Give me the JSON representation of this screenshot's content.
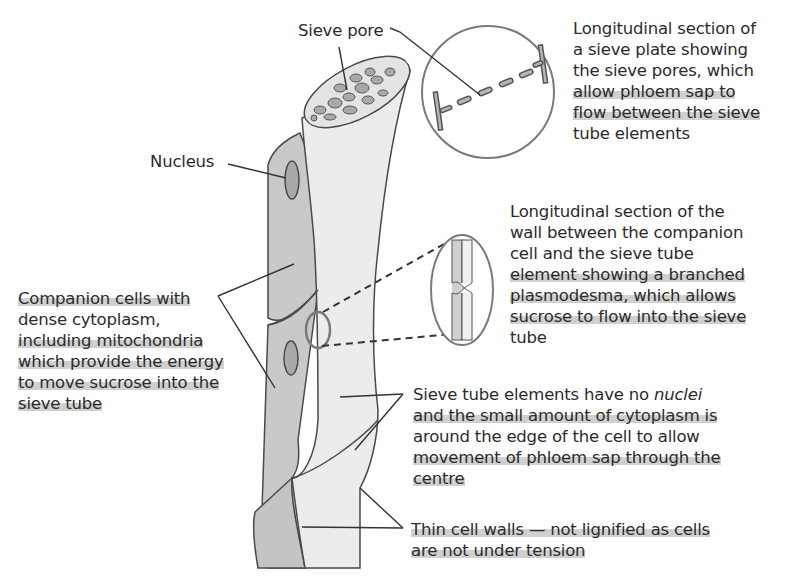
{
  "labels": {
    "sieve_pore": "Sieve pore",
    "nucleus": "Nucleus",
    "sieve_plate": {
      "lines": [
        "Longitudinal section of",
        "a sieve plate showing",
        "the sieve pores, which",
        "allow phloem sap to",
        "flow between the sieve",
        "tube elements"
      ]
    },
    "plasmodesma": {
      "lines": [
        "Longitudinal section of the",
        "wall between the companion",
        "cell and the sieve tube",
        "element showing a branched",
        "plasmodesma, which allows",
        "sucrose to flow into the sieve",
        "tube"
      ]
    },
    "companion_cells": {
      "lines": [
        "Companion cells with",
        "dense cytoplasm,",
        "including mitochondria",
        "which provide the energy",
        "to move sucrose into the",
        "sieve tube"
      ]
    },
    "sieve_tube_elements": {
      "line1_a": "Sieve tube elements have no ",
      "line1_b": "nuclei",
      "lines": [
        "and the small amount of cytoplasm is",
        "around the edge of the cell to allow",
        "movement of phloem sap through the",
        "centre"
      ]
    },
    "thin_walls": {
      "lines": [
        "Thin cell walls — not lignified as cells",
        "are not under tension"
      ]
    }
  },
  "colors": {
    "companion_fill": "#c9c9c9",
    "sieve_fill": "#ececec",
    "nucleus_fill": "#a9a9a9",
    "stroke": "#4a4a4a",
    "highlight": "#9a9a9a"
  }
}
